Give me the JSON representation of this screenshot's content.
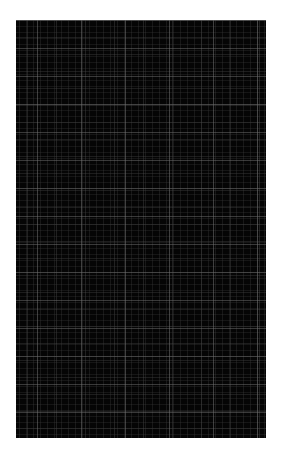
{
  "image": {
    "description": "Dark plaid/grid textured panel on white background",
    "panel": {
      "background_color": "#050505",
      "grid_line_color": "#6e6e6e",
      "page_background": "#ffffff"
    }
  }
}
